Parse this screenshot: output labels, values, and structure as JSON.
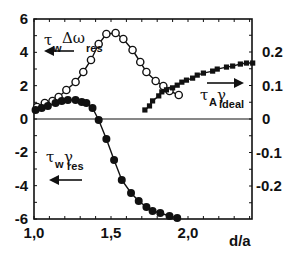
{
  "chart_data": {
    "type": "line",
    "title": "",
    "xlabel": "d/a",
    "ylabel_left": "",
    "ylabel_right": "",
    "xlim": [
      1.0,
      2.42
    ],
    "ylim_left": [
      -6,
      6
    ],
    "ylim_right": [
      -0.3,
      0.3
    ],
    "x_ticks": [
      {
        "v": 1.0,
        "label": "1,0"
      },
      {
        "v": 1.5,
        "label": "1,5"
      },
      {
        "v": 2.0,
        "label": "2,0"
      }
    ],
    "y_ticks_left": [
      {
        "v": 6,
        "label": "6"
      },
      {
        "v": 4,
        "label": "4"
      },
      {
        "v": 2,
        "label": "2"
      },
      {
        "v": 0,
        "label": "0"
      },
      {
        "v": -2,
        "label": "-2"
      },
      {
        "v": -4,
        "label": "-4"
      },
      {
        "v": -6,
        "label": "-6"
      }
    ],
    "y_ticks_right": [
      {
        "v": 0.2,
        "label": "0.2"
      },
      {
        "v": 0.1,
        "label": "0.1"
      },
      {
        "v": 0,
        "label": "0"
      },
      {
        "v": -0.1,
        "label": "-0.1"
      },
      {
        "v": -0.2,
        "label": "-0.2"
      }
    ],
    "grid": false,
    "zero_line": true,
    "series": [
      {
        "name": "τw Δω_res",
        "axis": "left",
        "marker": "open-circle",
        "x": [
          1.02,
          1.07,
          1.12,
          1.16,
          1.21,
          1.27,
          1.32,
          1.37,
          1.42,
          1.47,
          1.53,
          1.58,
          1.64,
          1.69,
          1.73,
          1.79,
          1.84,
          1.88,
          1.94
        ],
        "y": [
          0.72,
          0.96,
          1.08,
          1.32,
          1.74,
          2.22,
          2.82,
          3.54,
          4.5,
          5.1,
          5.16,
          4.8,
          4.14,
          3.42,
          2.82,
          2.28,
          1.98,
          1.68,
          1.44
        ]
      },
      {
        "name": "τw γ_res",
        "axis": "left",
        "marker": "filled-circle",
        "x": [
          1.01,
          1.05,
          1.09,
          1.14,
          1.18,
          1.22,
          1.27,
          1.31,
          1.34,
          1.38,
          1.42,
          1.47,
          1.52,
          1.57,
          1.63,
          1.68,
          1.73,
          1.77,
          1.82,
          1.88,
          1.93
        ],
        "y": [
          0.54,
          0.66,
          0.78,
          0.96,
          1.08,
          1.14,
          1.14,
          1.02,
          0.96,
          0.66,
          -0.06,
          -1.2,
          -2.46,
          -3.66,
          -4.44,
          -4.92,
          -5.28,
          -5.52,
          -5.64,
          -5.82,
          -5.94
        ]
      },
      {
        "name": "τA γ_ideal",
        "axis": "right",
        "marker": "filled-square",
        "x": [
          1.72,
          1.75,
          1.77,
          1.81,
          1.83,
          1.86,
          1.9,
          1.93,
          1.96,
          1.99,
          2.03,
          2.06,
          2.1,
          2.16,
          2.19,
          2.25,
          2.29,
          2.34,
          2.38,
          2.42
        ],
        "y": [
          0.027,
          0.039,
          0.054,
          0.069,
          0.081,
          0.087,
          0.093,
          0.101,
          0.11,
          0.116,
          0.122,
          0.131,
          0.137,
          0.143,
          0.149,
          0.155,
          0.158,
          0.164,
          0.167,
          0.167
        ]
      }
    ],
    "annotations": [
      {
        "text": "τw Δω_res",
        "arrow": "left",
        "pos": "upper-left"
      },
      {
        "text": "τw γ_res",
        "arrow": "left",
        "pos": "lower-left"
      },
      {
        "text": "τA γ_ideal",
        "arrow": "right",
        "pos": "right"
      }
    ]
  },
  "labels": {
    "xlabel": "d/a",
    "ann1_main": "τ",
    "ann1_sub": "w",
    "ann1_tail": "Δω",
    "ann1_sub2": "res",
    "ann2_main": "τ",
    "ann2_sub": "w",
    "ann2_tail": "γ",
    "ann2_sub2": "res",
    "ann3_main": "τ",
    "ann3_sub": "A",
    "ann3_tail": "γ",
    "ann3_sub2": "ideal"
  }
}
